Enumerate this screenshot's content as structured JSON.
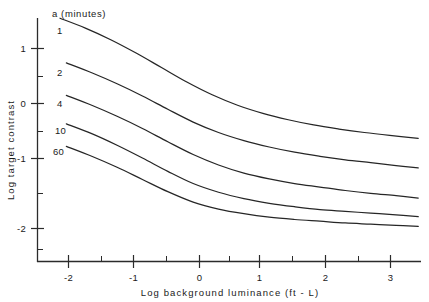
{
  "chart_data": {
    "type": "line",
    "title": "",
    "xlabel": "Log background luminance  (ft - L)",
    "ylabel": "Log target contrast",
    "legend_title": "a (minutes)",
    "legend_position": "inline-left-of-curves",
    "grid": false,
    "xlim": [
      -2.5,
      3.6
    ],
    "ylim": [
      -2.45,
      1.55
    ],
    "xticks": [
      -2,
      -1,
      0,
      1,
      2,
      3
    ],
    "xtick_labels": [
      "-2",
      "-1",
      "0",
      "1",
      "2",
      "3"
    ],
    "xminor_ticks": [
      -2.5,
      -1.5,
      -0.5,
      0.5,
      1.5,
      2.5,
      3.5
    ],
    "yticks": [
      1,
      0,
      -1,
      -2
    ],
    "ytick_labels": [
      "1",
      "0",
      "-1",
      "-2"
    ],
    "yminor_ticks": [
      1.5,
      0.5,
      -0.5,
      -1.5,
      -2.45
    ],
    "series": [
      {
        "name": "1",
        "label": "1",
        "x": [
          -2.2,
          -1.8,
          -1.4,
          -1.0,
          -0.6,
          -0.2,
          0.2,
          0.6,
          1.0,
          1.4,
          1.8,
          2.2,
          2.6,
          3.0,
          3.45
        ],
        "y": [
          1.47,
          1.3,
          1.1,
          0.87,
          0.62,
          0.37,
          0.15,
          -0.03,
          -0.17,
          -0.28,
          -0.37,
          -0.44,
          -0.5,
          -0.55,
          -0.6
        ]
      },
      {
        "name": "2",
        "label": "2",
        "x": [
          -2.1,
          -1.7,
          -1.3,
          -0.9,
          -0.5,
          -0.1,
          0.3,
          0.7,
          1.1,
          1.5,
          1.9,
          2.3,
          2.7,
          3.1,
          3.45
        ],
        "y": [
          0.7,
          0.53,
          0.34,
          0.13,
          -0.1,
          -0.32,
          -0.5,
          -0.64,
          -0.75,
          -0.84,
          -0.91,
          -0.97,
          -1.02,
          -1.07,
          -1.11
        ]
      },
      {
        "name": "4",
        "label": "4",
        "x": [
          -2.1,
          -1.7,
          -1.3,
          -0.9,
          -0.5,
          -0.1,
          0.3,
          0.7,
          1.1,
          1.5,
          1.9,
          2.3,
          2.7,
          3.1,
          3.45
        ],
        "y": [
          0.14,
          -0.03,
          -0.22,
          -0.43,
          -0.66,
          -0.88,
          -1.06,
          -1.2,
          -1.3,
          -1.38,
          -1.44,
          -1.5,
          -1.55,
          -1.59,
          -1.63
        ]
      },
      {
        "name": "10",
        "label": "10",
        "x": [
          -2.1,
          -1.7,
          -1.3,
          -0.9,
          -0.5,
          -0.1,
          0.3,
          0.7,
          1.1,
          1.5,
          1.9,
          2.3,
          2.7,
          3.1,
          3.45
        ],
        "y": [
          -0.35,
          -0.52,
          -0.72,
          -0.94,
          -1.17,
          -1.38,
          -1.53,
          -1.64,
          -1.72,
          -1.78,
          -1.83,
          -1.86,
          -1.89,
          -1.92,
          -1.95
        ]
      },
      {
        "name": "60",
        "label": "60",
        "x": [
          -2.1,
          -1.7,
          -1.3,
          -0.9,
          -0.5,
          -0.1,
          0.3,
          0.7,
          1.1,
          1.5,
          1.9,
          2.3,
          2.7,
          3.1,
          3.45
        ],
        "y": [
          -0.74,
          -0.91,
          -1.1,
          -1.31,
          -1.52,
          -1.7,
          -1.82,
          -1.9,
          -1.96,
          -2.0,
          -2.03,
          -2.06,
          -2.08,
          -2.1,
          -2.12
        ]
      }
    ],
    "colors": {
      "curve": "#262626",
      "axis": "#2b2b2b",
      "background": "#ffffff",
      "text": "#1a1a1a"
    }
  }
}
